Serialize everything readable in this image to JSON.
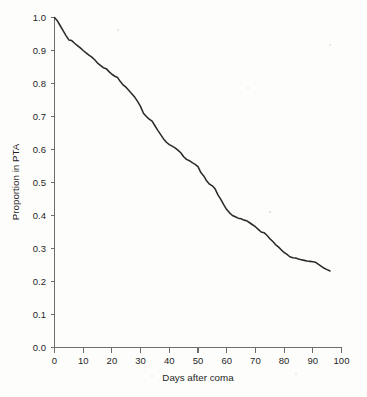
{
  "chart_data": {
    "type": "line",
    "title": "",
    "subtitle": "",
    "xlabel": "Days after coma",
    "ylabel": "Proportion in PTA",
    "xlim": [
      0,
      100
    ],
    "ylim": [
      0.0,
      1.0
    ],
    "grid": false,
    "legend": null,
    "legend_position": "none",
    "xticks": [
      "0",
      "10",
      "20",
      "30",
      "40",
      "50",
      "60",
      "70",
      "80",
      "90",
      "100"
    ],
    "xtick_values": [
      0,
      10,
      20,
      30,
      40,
      50,
      60,
      70,
      80,
      90,
      100
    ],
    "yticks": [
      "0.0",
      "0.1",
      "0.2",
      "0.3",
      "0.4",
      "0.5",
      "0.6",
      "0.7",
      "0.8",
      "0.9",
      "1.0"
    ],
    "ytick_values": [
      0.0,
      0.1,
      0.2,
      0.3,
      0.4,
      0.5,
      0.6,
      0.7,
      0.8,
      0.9,
      1.0
    ],
    "line_color": "#2b2b2b",
    "axis_color": "#6e6e6e",
    "series": [
      {
        "name": "Proportion in PTA",
        "x": [
          0,
          1,
          2,
          3,
          4,
          5,
          6,
          7,
          8,
          9,
          10,
          11,
          12,
          13,
          14,
          15,
          16,
          17,
          18,
          19,
          20,
          21,
          22,
          23,
          24,
          25,
          26,
          27,
          28,
          29,
          30,
          31,
          32,
          33,
          34,
          35,
          36,
          37,
          38,
          39,
          40,
          41,
          42,
          43,
          44,
          45,
          46,
          47,
          48,
          49,
          50,
          51,
          52,
          53,
          54,
          55,
          56,
          57,
          58,
          59,
          60,
          61,
          62,
          63,
          64,
          65,
          66,
          67,
          68,
          69,
          70,
          71,
          72,
          73,
          74,
          75,
          76,
          77,
          78,
          79,
          80,
          81,
          82,
          83,
          84,
          85,
          86,
          87,
          88,
          89,
          90,
          91,
          92,
          93,
          94,
          95,
          96
        ],
        "values": [
          1.0,
          0.99,
          0.975,
          0.96,
          0.945,
          0.932,
          0.93,
          0.922,
          0.915,
          0.908,
          0.9,
          0.893,
          0.886,
          0.88,
          0.872,
          0.862,
          0.855,
          0.848,
          0.845,
          0.836,
          0.828,
          0.822,
          0.818,
          0.805,
          0.795,
          0.788,
          0.778,
          0.768,
          0.758,
          0.745,
          0.73,
          0.71,
          0.7,
          0.692,
          0.686,
          0.672,
          0.658,
          0.645,
          0.632,
          0.622,
          0.615,
          0.61,
          0.605,
          0.598,
          0.59,
          0.578,
          0.57,
          0.566,
          0.56,
          0.555,
          0.548,
          0.53,
          0.52,
          0.505,
          0.495,
          0.49,
          0.48,
          0.462,
          0.448,
          0.432,
          0.418,
          0.408,
          0.4,
          0.396,
          0.392,
          0.39,
          0.386,
          0.384,
          0.378,
          0.372,
          0.366,
          0.358,
          0.35,
          0.348,
          0.34,
          0.33,
          0.322,
          0.312,
          0.305,
          0.296,
          0.288,
          0.282,
          0.275,
          0.272,
          0.271,
          0.268,
          0.266,
          0.264,
          0.262,
          0.261,
          0.26,
          0.258,
          0.252,
          0.246,
          0.24,
          0.236,
          0.232
        ]
      }
    ]
  },
  "annotations": {
    "start_value": "1.0",
    "end_value": "0.23",
    "end_day": "96"
  }
}
